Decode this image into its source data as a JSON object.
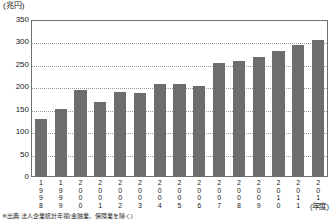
{
  "chart_data": {
    "type": "bar",
    "title": "",
    "xlabel": "(年度)",
    "ylabel": "(兆円)",
    "ylim": [
      0,
      350
    ],
    "ytick_step": 50,
    "grid": true,
    "legend": null,
    "bar_color": "#6d6d6d",
    "categories": [
      "1998",
      "1999",
      "2000",
      "2001",
      "2002",
      "2003",
      "2004",
      "2005",
      "2006",
      "2007",
      "2008",
      "2009",
      "2010",
      "2011",
      "2012"
    ],
    "values": [
      130,
      152,
      193,
      167,
      190,
      187,
      207,
      207,
      203,
      255,
      259,
      268,
      282,
      295,
      305
    ],
    "ytick_labels": [
      "350",
      "300",
      "250",
      "200",
      "150",
      "100",
      "50",
      "0"
    ]
  },
  "axis": {
    "unit_y": "(兆円)",
    "unit_x": "(年度)"
  },
  "footnote": {
    "text": "※出典:法人企業統計年報(金融業、保険業を除く)"
  }
}
